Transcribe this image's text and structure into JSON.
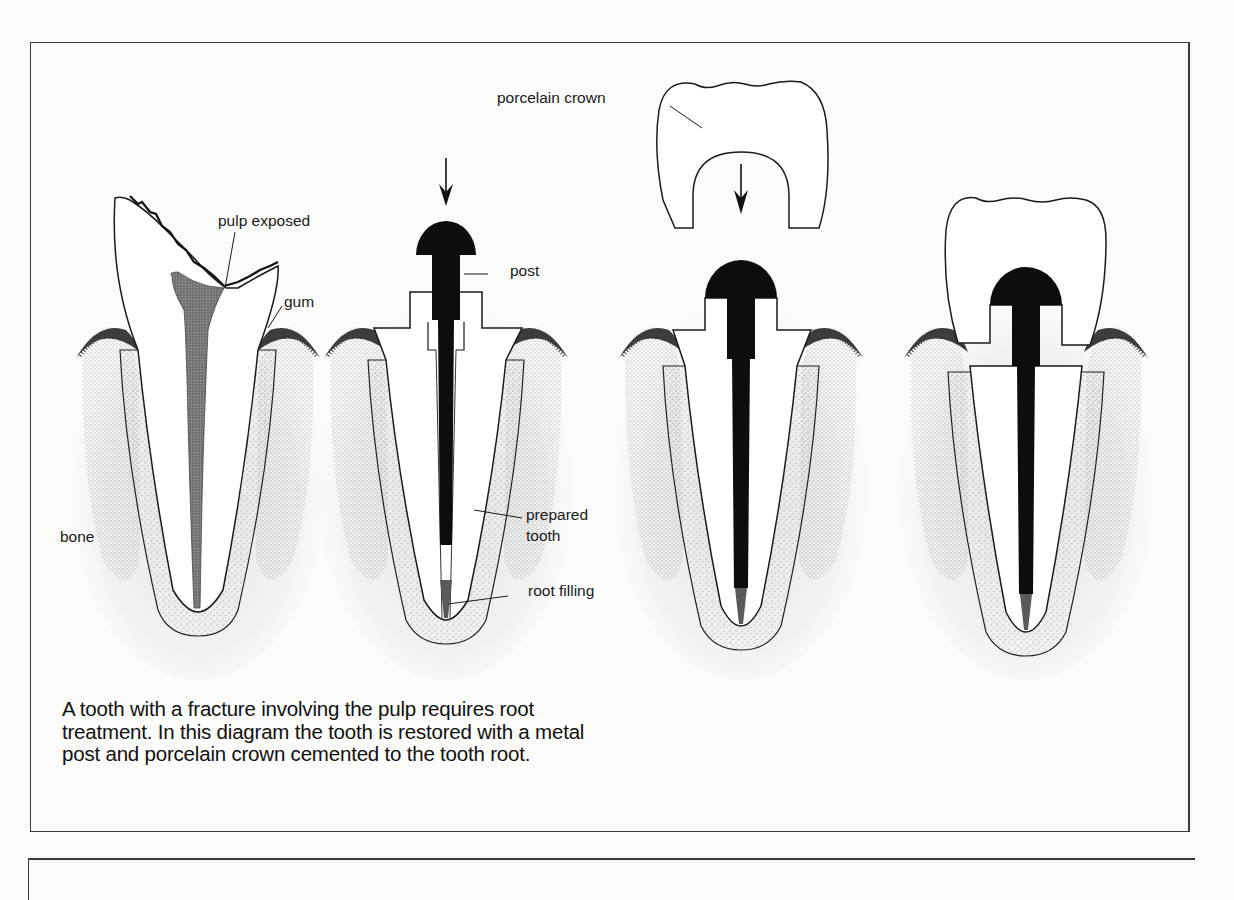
{
  "figure": {
    "labels": {
      "pulp_exposed": "pulp exposed",
      "gum": "gum",
      "bone": "bone",
      "post": "post",
      "prepared_tooth_line1": "prepared",
      "prepared_tooth_line2": "tooth",
      "root_filling": "root filling",
      "porcelain_crown": "porcelain crown"
    },
    "stages": [
      {
        "name": "fractured-tooth",
        "description": "tooth with fracture exposing pulp"
      },
      {
        "name": "post-insertion",
        "description": "metal post inserted into prepared root"
      },
      {
        "name": "crown-placement",
        "description": "porcelain crown lowered onto post"
      },
      {
        "name": "restored-tooth",
        "description": "crown cemented to tooth root"
      }
    ],
    "caption": "A tooth with a fracture involving the pulp requires root treatment. In this diagram the tooth is restored with a metal post and porcelain crown cemented to the tooth root.",
    "colors": {
      "outline": "#1a1a1a",
      "post_metal": "#0d0d0d",
      "root_filling": "#5a5a5a",
      "pulp": "#6e6e6e",
      "bone_stipple": "#9a9a9a",
      "gum": "#4a4a4a",
      "paper": "#fbfbf9"
    }
  }
}
